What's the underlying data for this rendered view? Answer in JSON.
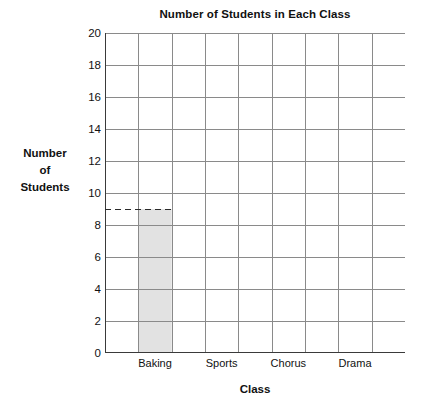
{
  "chart_data": {
    "type": "bar",
    "title": "Number of Students in Each Class",
    "xlabel": "Class",
    "ylabel": "Number of Students",
    "ylabel_lines": [
      "Number",
      "of",
      "Students"
    ],
    "categories": [
      "Baking",
      "Sports",
      "Chorus",
      "Drama"
    ],
    "values": [
      9,
      null,
      null,
      null
    ],
    "ylim": [
      0,
      20
    ],
    "ytick_step": 2,
    "yticks": [
      0,
      2,
      4,
      6,
      8,
      10,
      12,
      14,
      16,
      18,
      20
    ],
    "ytick_labels": [
      "0",
      "2",
      "4",
      "6",
      "8",
      "10",
      "12",
      "14",
      "16",
      "18",
      "20"
    ],
    "grid": true,
    "grid_columns": 9,
    "legend": "none",
    "annotations": [
      {
        "type": "dashed-guideline",
        "value": 9,
        "label": "",
        "from_axis": true,
        "to_category": "Baking"
      }
    ],
    "bar_color": "#e2e2e2",
    "grid_color": "#8a8a8a",
    "axis_color": "#3a3a3a"
  }
}
